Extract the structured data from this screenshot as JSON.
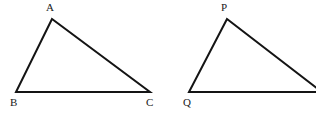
{
  "figure": {
    "background_color": "#ffffff",
    "stroke_color": "#141414",
    "stroke_width": 2,
    "label_color": "#1a1a1a",
    "canvas": {
      "width": 316,
      "height": 116
    },
    "shapes": [
      {
        "name": "triangle-abc",
        "points": "52,19 16,92 150,92",
        "vertices": [
          {
            "id": "A",
            "label": "A",
            "x": 52,
            "y": 19,
            "label_x": 46,
            "label_y": 2
          },
          {
            "id": "B",
            "label": "B",
            "x": 16,
            "y": 92,
            "label_x": 10,
            "label_y": 97
          },
          {
            "id": "C",
            "label": "C",
            "x": 150,
            "y": 92,
            "label_x": 146,
            "label_y": 97
          }
        ]
      },
      {
        "name": "triangle-pqr",
        "points": "227,19 189,92 322,92",
        "vertices": [
          {
            "id": "P",
            "label": "P",
            "x": 227,
            "y": 19,
            "label_x": 221,
            "label_y": 2
          },
          {
            "id": "Q",
            "label": "Q",
            "x": 189,
            "y": 92,
            "label_x": 183,
            "label_y": 97
          }
        ]
      }
    ]
  }
}
